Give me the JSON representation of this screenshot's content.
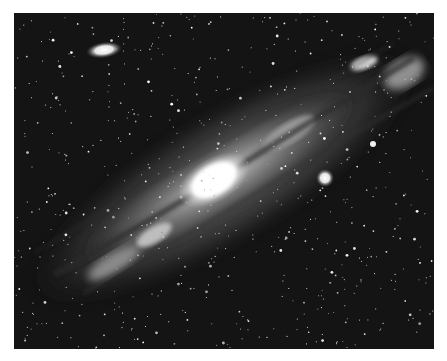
{
  "image": {
    "subject": "Andromeda Galaxy with satellite galaxies",
    "style": "grayscale astrophotograph",
    "frame": {
      "x": 14,
      "y": 13,
      "width": 420,
      "height": 336
    },
    "colors": {
      "sky": "#141414",
      "border": "#ffffff",
      "core": "#ffffff",
      "disk": "#8a8a8a",
      "star": "#e8e8e8"
    },
    "objects": [
      {
        "name": "main-galaxy",
        "cx": 210,
        "cy": 165,
        "rx": 210,
        "ry": 62,
        "rotation": -31
      },
      {
        "name": "galaxy-core",
        "cx": 200,
        "cy": 167,
        "rx": 40,
        "ry": 22,
        "rotation": -31
      },
      {
        "name": "satellite-galaxy-elliptical",
        "cx": 90,
        "cy": 37,
        "rx": 18,
        "ry": 8,
        "rotation": -8
      },
      {
        "name": "satellite-galaxy-compact",
        "cx": 311,
        "cy": 165,
        "r": 8
      },
      {
        "name": "bright-star",
        "cx": 359,
        "cy": 131,
        "r": 3
      }
    ]
  }
}
